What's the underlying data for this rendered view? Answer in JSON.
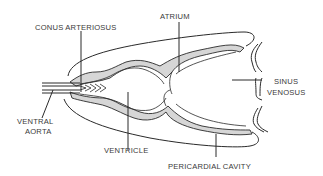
{
  "diagram": {
    "labels": {
      "conus_arteriosus": "CONUS ARTERIOSUS",
      "atrium": "ATRIUM",
      "sinus_venosus_line1": "SINUS",
      "sinus_venosus_line2": "VENOSUS",
      "ventral_aorta_line1": "VENTRAL",
      "ventral_aorta_line2": "AORTA",
      "ventricle": "VENTRICLE",
      "pericardial_cavity": "PERICARDIAL CAVITY"
    },
    "colors": {
      "line": "#2a2a2a",
      "wall_fill": "#d6d6d6",
      "text": "#3a3a3a",
      "background": "#ffffff"
    }
  }
}
